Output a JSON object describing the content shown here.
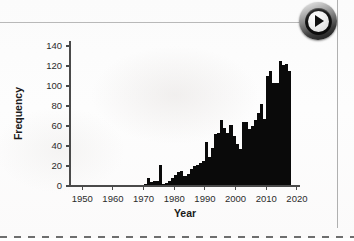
{
  "window": {
    "play_button": {
      "icon": "play-triangle-icon",
      "label": "Play"
    }
  },
  "chart_data": {
    "type": "bar",
    "title": "",
    "subtitle": "",
    "xlabel": "Year",
    "ylabel": "Frequency",
    "xlim": [
      1946,
      2021
    ],
    "ylim": [
      0,
      145
    ],
    "grid": false,
    "legend": null,
    "bar_color": "#0a0a0a",
    "x_ticks": [
      1950,
      1960,
      1970,
      1980,
      1990,
      2000,
      2010,
      2020
    ],
    "y_ticks": [
      0,
      20,
      40,
      60,
      80,
      100,
      120,
      140
    ],
    "categories": [
      1948,
      1949,
      1950,
      1951,
      1952,
      1953,
      1954,
      1955,
      1956,
      1957,
      1958,
      1959,
      1960,
      1961,
      1962,
      1963,
      1964,
      1965,
      1966,
      1967,
      1968,
      1969,
      1970,
      1971,
      1972,
      1973,
      1974,
      1975,
      1976,
      1977,
      1978,
      1979,
      1980,
      1981,
      1982,
      1983,
      1984,
      1985,
      1986,
      1987,
      1988,
      1989,
      1990,
      1991,
      1992,
      1993,
      1994,
      1995,
      1996,
      1997,
      1998,
      1999,
      2000,
      2001,
      2002,
      2003,
      2004,
      2005,
      2006,
      2007,
      2008,
      2009,
      2010,
      2011,
      2012,
      2013,
      2014,
      2015,
      2016,
      2017
    ],
    "values": [
      0,
      0,
      0,
      0,
      0,
      1,
      0,
      0,
      0,
      0,
      0,
      0,
      1,
      1,
      0,
      0,
      0,
      0,
      0,
      1,
      1,
      1,
      2,
      8,
      4,
      5,
      5,
      21,
      2,
      3,
      5,
      8,
      11,
      14,
      15,
      10,
      12,
      17,
      20,
      21,
      23,
      25,
      44,
      29,
      38,
      52,
      53,
      66,
      58,
      53,
      61,
      50,
      42,
      37,
      64,
      64,
      57,
      60,
      66,
      73,
      82,
      67,
      110,
      115,
      103,
      103,
      125,
      121,
      122,
      115
    ]
  }
}
